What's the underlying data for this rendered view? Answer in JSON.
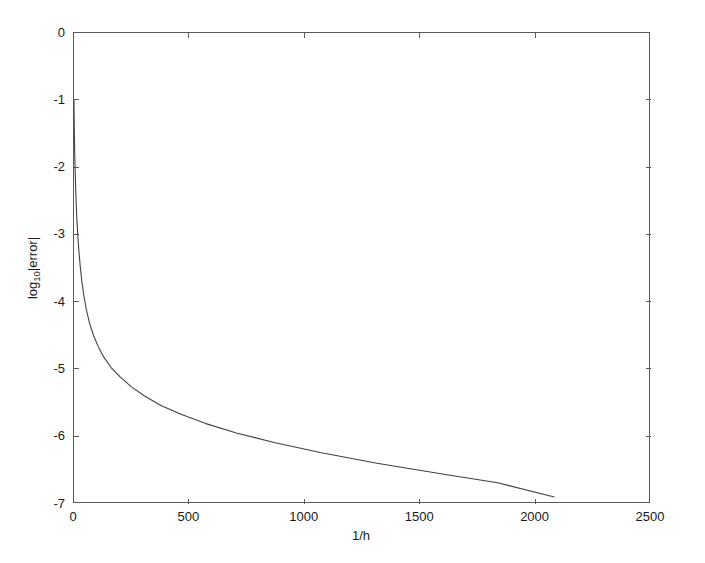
{
  "figure": {
    "background_color": "#ffffff",
    "axes_color": "#5a5a5a",
    "curve_color": "#404040"
  },
  "chart_data": {
    "type": "line",
    "title": "",
    "subtitle": "",
    "xlabel": "1/h",
    "ylabel": "log10|error|",
    "ylabel_display": "log",
    "ylabel_sub": "10",
    "ylabel_tail": "|error|",
    "xlim": [
      0,
      2500
    ],
    "ylim": [
      -7,
      0
    ],
    "xticks": [
      0,
      500,
      1000,
      1500,
      2000,
      2500
    ],
    "xticklabels": [
      "0",
      "500",
      "1000",
      "1500",
      "2000",
      "2500"
    ],
    "yticks": [
      0,
      -1,
      -2,
      -3,
      -4,
      -5,
      -6,
      -7
    ],
    "yticklabels": [
      "0",
      "-1",
      "-2",
      "-3",
      "-4",
      "-5",
      "-6",
      "-7"
    ],
    "grid": false,
    "legend": null,
    "legend_position": "none",
    "series": [
      {
        "name": "convergence",
        "x": [
          4,
          5,
          6,
          8,
          10,
          13,
          16,
          20,
          25,
          31,
          38,
          47,
          58,
          72,
          89,
          110,
          135,
          166,
          205,
          252,
          310,
          381,
          468,
          576,
          708,
          871,
          1071,
          1317,
          1620,
          1840,
          2085
        ],
        "y": [
          -1.02,
          -1.28,
          -1.52,
          -1.9,
          -2.16,
          -2.48,
          -2.73,
          -2.98,
          -3.23,
          -3.47,
          -3.7,
          -3.92,
          -4.13,
          -4.33,
          -4.51,
          -4.68,
          -4.84,
          -4.99,
          -5.13,
          -5.27,
          -5.41,
          -5.55,
          -5.68,
          -5.82,
          -5.96,
          -6.1,
          -6.25,
          -6.41,
          -6.58,
          -6.7,
          -6.91
        ]
      }
    ],
    "annotations": []
  },
  "axis_geometry": {
    "plot_left_px": 73,
    "plot_right_px": 650,
    "plot_top_px": 32,
    "plot_bottom_px": 503
  }
}
